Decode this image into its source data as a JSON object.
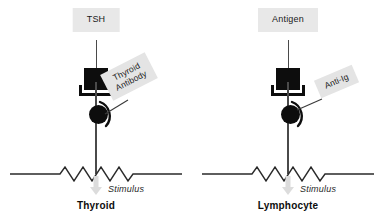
{
  "figure": {
    "background_color": "#ffffff",
    "label_box_color": "#e8e8e8",
    "ink_color": "#0d0d0d",
    "line_color": "#4a4a4a",
    "arrow_color": "#d8d8d8"
  },
  "panels": [
    {
      "id": "thyroid",
      "cell_name": "Thyroid",
      "ligand_label": "TSH",
      "antibody_label": "Thyroid\nAntibody",
      "antibody_label_line1": "Thyroid",
      "antibody_label_line2": "Antibody",
      "stimulus_label": "Stimulus",
      "antibody_rotation_deg": -27
    },
    {
      "id": "lymphocyte",
      "cell_name": "Lymphocyte",
      "ligand_label": "Antigen",
      "antibody_label": "Anti-Ig",
      "antibody_label_line1": "Anti-Ig",
      "antibody_label_line2": "",
      "stimulus_label": "Stimulus",
      "antibody_rotation_deg": -23
    }
  ]
}
